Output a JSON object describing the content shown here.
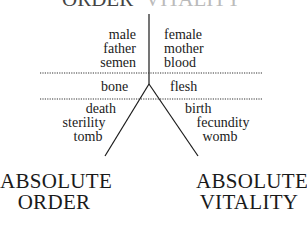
{
  "diagram": {
    "top_cutoff": {
      "left": "ORDER",
      "right": "VITALITY"
    },
    "upper_left": [
      "male",
      "father",
      "semen"
    ],
    "upper_right": [
      "female",
      "mother",
      "blood"
    ],
    "middle_left": "bone",
    "middle_right": "flesh",
    "lower_left": [
      "death",
      "sterility",
      "tomb"
    ],
    "lower_right": [
      "birth",
      "fecundity",
      "womb"
    ],
    "pole_left": [
      "ABSOLUTE",
      "ORDER"
    ],
    "pole_right": [
      "ABSOLUTE",
      "VITALITY"
    ],
    "colors": {
      "ink": "#1a1a1a",
      "background": "#ffffff"
    }
  }
}
